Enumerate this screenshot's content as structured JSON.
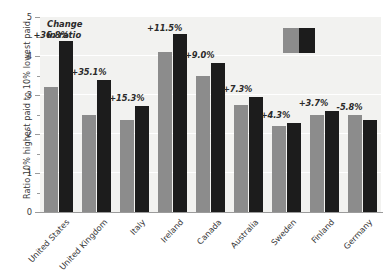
{
  "chart_data": {
    "type": "bar",
    "title": "",
    "xlabel": "",
    "ylabel": "Ratio 10% highest paid to 10% lowest paid",
    "ylim": [
      0,
      5
    ],
    "yticks": [
      0,
      1,
      2,
      3,
      4,
      5
    ],
    "ytick_labels": [
      "0",
      "1",
      "2",
      "3",
      "4",
      "5"
    ],
    "minor_yticks": [
      0.5,
      1.5,
      2.5,
      3.5,
      4.5
    ],
    "grid": true,
    "legend_position": "top-right",
    "legend_entries": [
      {
        "name": "earlier",
        "color": "#8c8c8c"
      },
      {
        "name": "later",
        "color": "#1c1c1c"
      }
    ],
    "categories": [
      "United States",
      "United Kingdom",
      "Italy",
      "Ireland",
      "Canada",
      "Australia",
      "Sweden",
      "Finland",
      "Germany"
    ],
    "series": [
      {
        "name": "earlier",
        "color": "#8c8c8c",
        "values": [
          3.2,
          2.5,
          2.35,
          4.1,
          3.5,
          2.75,
          2.2,
          2.5,
          2.5
        ]
      },
      {
        "name": "later",
        "color": "#1c1c1c",
        "values": [
          4.38,
          3.38,
          2.71,
          4.57,
          3.81,
          2.95,
          2.29,
          2.59,
          2.36
        ]
      }
    ],
    "annotations": [
      {
        "category": "United States",
        "text": "+36.8%"
      },
      {
        "category": "United Kingdom",
        "text": "+35.1%"
      },
      {
        "category": "Italy",
        "text": "+15.3%"
      },
      {
        "category": "Ireland",
        "text": "+11.5%"
      },
      {
        "category": "Canada",
        "text": "+9.0%"
      },
      {
        "category": "Australia",
        "text": "+7.3%"
      },
      {
        "category": "Sweden",
        "text": "+4.3%"
      },
      {
        "category": "Finland",
        "text": "+3.7%"
      },
      {
        "category": "Germany",
        "text": "-5.8%"
      }
    ],
    "caption_line1": "Change",
    "caption_line2": "in ratio",
    "colors": {
      "plot_background": "#f2f2f0",
      "page_background": "#ffffff",
      "axis": "#9b9b9b",
      "text": "#39393a",
      "gridline": "#ffffff"
    }
  }
}
